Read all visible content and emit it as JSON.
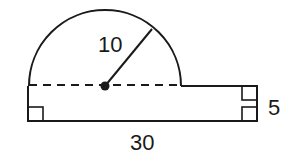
{
  "figure": {
    "shapes": {
      "semicircle": {
        "center": [
          105,
          86
        ],
        "radius": 76,
        "radius_label": "10"
      },
      "rectangle": {
        "x": 28,
        "y": 86,
        "width": 229,
        "height": 35,
        "width_label": "30",
        "height_label": "5"
      }
    },
    "labels": {
      "radius": "10",
      "length": "30",
      "height": "5"
    },
    "colors": {
      "line": "#1a1a1a",
      "background": "#ffffff"
    }
  }
}
